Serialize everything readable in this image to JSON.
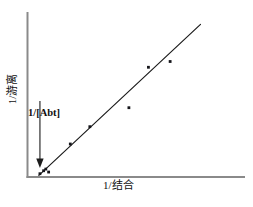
{
  "chart_data": {
    "type": "scatter",
    "title": "",
    "subtitle": "",
    "xlabel": "1/结合",
    "ylabel": "1/游离",
    "grid": false,
    "legend": null,
    "xlim": [
      0,
      1
    ],
    "ylim": [
      0,
      1
    ],
    "axis_ticks": {
      "x": [],
      "y": []
    },
    "annotations": [
      {
        "text": "1/[Abt]",
        "target": "y-intercept",
        "arrow": true,
        "arrow_from": [
          0.055,
          0.46
        ],
        "arrow_to": [
          0.055,
          0.055
        ]
      }
    ],
    "series": [
      {
        "name": "data points",
        "marker": "square",
        "points": [
          [
            0.055,
            0.02
          ],
          [
            0.072,
            0.038
          ],
          [
            0.082,
            0.048
          ],
          [
            0.095,
            0.03
          ],
          [
            0.195,
            0.2
          ],
          [
            0.285,
            0.305
          ],
          [
            0.465,
            0.42
          ],
          [
            0.555,
            0.665
          ],
          [
            0.655,
            0.7
          ]
        ]
      }
    ],
    "fit_line": {
      "name": "regression line",
      "from": [
        0.05,
        0.01
      ],
      "to": [
        0.795,
        0.925
      ]
    }
  },
  "labels": {
    "x_axis": "1/结合",
    "y_axis": "1/游离",
    "intercept_annotation": "1/[Abt]"
  },
  "colors": {
    "axis": "#8a8a8a",
    "line": "#1c1c1c",
    "marker": "#15151a",
    "text": "#111111",
    "background": "#ffffff"
  }
}
